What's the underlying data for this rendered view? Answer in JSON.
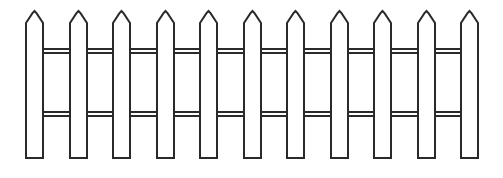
{
  "figure": {
    "style": "black-and-white line art",
    "background_color": "#ffffff",
    "stroke_color": "#2a2a2a",
    "fill_color": "#ffffff",
    "stroke_width": 2
  },
  "diagram_data": {
    "type": "line-drawing",
    "canvas": {
      "width": 503,
      "height": 178
    },
    "elements": {
      "picket_count": 11,
      "rail_count": 2
    },
    "picket_geometry": {
      "width": 17,
      "top_apex_y": 11,
      "shoulder_y": 23,
      "bottom_y": 158,
      "first_left_x": 26,
      "pitch": 43.6,
      "note": "pointed chamfered top, rectangular body"
    },
    "pickets": [
      {
        "index": 1,
        "left_x": 26,
        "right_x": 43,
        "apex_x": 34.5
      },
      {
        "index": 2,
        "left_x": 70,
        "right_x": 87,
        "apex_x": 78.5
      },
      {
        "index": 3,
        "left_x": 113,
        "right_x": 130,
        "apex_x": 121.5
      },
      {
        "index": 4,
        "left_x": 157,
        "right_x": 174,
        "apex_x": 165.5
      },
      {
        "index": 5,
        "left_x": 200,
        "right_x": 217,
        "apex_x": 208.5
      },
      {
        "index": 6,
        "left_x": 244,
        "right_x": 261,
        "apex_x": 252.5
      },
      {
        "index": 7,
        "left_x": 287,
        "right_x": 304,
        "apex_x": 295.5
      },
      {
        "index": 8,
        "left_x": 331,
        "right_x": 348,
        "apex_x": 339.5
      },
      {
        "index": 9,
        "left_x": 374,
        "right_x": 391,
        "apex_x": 382.5
      },
      {
        "index": 10,
        "left_x": 418,
        "right_x": 435,
        "apex_x": 426.5
      },
      {
        "index": 11,
        "left_x": 461,
        "right_x": 478,
        "apex_x": 469.5
      }
    ],
    "rails": [
      {
        "index": 1,
        "name": "top-rail",
        "y_top": 49,
        "y_bottom": 53,
        "x_start": 43,
        "x_end": 461
      },
      {
        "index": 2,
        "name": "bottom-rail",
        "y_top": 112,
        "y_bottom": 116,
        "x_start": 43,
        "x_end": 461
      }
    ]
  }
}
